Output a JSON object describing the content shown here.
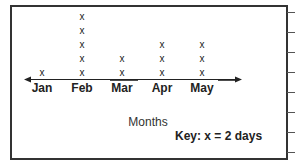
{
  "chart_data": {
    "type": "line-plot (dot plot)",
    "title": "",
    "xlabel": "Months",
    "ylabel": "",
    "categories": [
      "Jan",
      "Feb",
      "Mar",
      "Apr",
      "May"
    ],
    "values": [
      1,
      5,
      2,
      3,
      3
    ],
    "marker": "x",
    "key": "Key: x = 2 days",
    "days_per_marker": 2,
    "days_values": [
      2,
      10,
      4,
      6,
      6
    ],
    "axis": {
      "arrows": "both ends",
      "grid": false
    },
    "legend_position": "bottom-right"
  },
  "labels": {
    "months": [
      "Jan",
      "Feb",
      "Mar",
      "Apr",
      "May"
    ],
    "xlabel": "Months",
    "key": "Key: x = 2 days",
    "marker_glyph": "x"
  }
}
